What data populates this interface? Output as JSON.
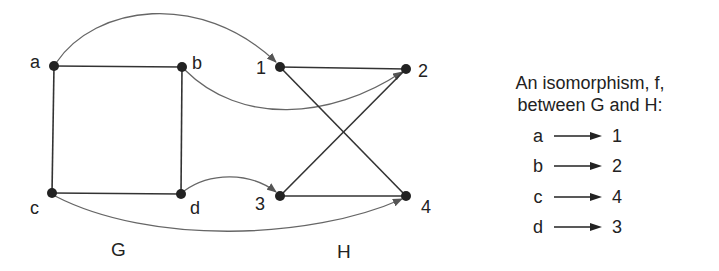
{
  "colors": {
    "edge": "#333333",
    "arc": "#666666",
    "node": "#222222",
    "text": "#222222"
  },
  "graph_g": {
    "name": "G",
    "nodes": [
      {
        "id": "a",
        "label": "a",
        "x": 54,
        "y": 66
      },
      {
        "id": "b",
        "label": "b",
        "x": 182,
        "y": 67
      },
      {
        "id": "c",
        "label": "c",
        "x": 52,
        "y": 193
      },
      {
        "id": "d",
        "label": "d",
        "x": 181,
        "y": 194
      }
    ],
    "edges": [
      [
        "a",
        "b"
      ],
      [
        "a",
        "c"
      ],
      [
        "b",
        "d"
      ],
      [
        "c",
        "d"
      ]
    ]
  },
  "graph_h": {
    "name": "H",
    "nodes": [
      {
        "id": "1",
        "label": "1",
        "x": 280,
        "y": 67
      },
      {
        "id": "2",
        "label": "2",
        "x": 406,
        "y": 69
      },
      {
        "id": "3",
        "label": "3",
        "x": 280,
        "y": 196
      },
      {
        "id": "4",
        "label": "4",
        "x": 406,
        "y": 196
      }
    ],
    "edges": [
      [
        "1",
        "2"
      ],
      [
        "1",
        "4"
      ],
      [
        "3",
        "2"
      ],
      [
        "3",
        "4"
      ]
    ]
  },
  "caption": {
    "line1": "An isomorphism, f,",
    "line2": "between G and H:"
  },
  "mapping": [
    {
      "from": "a",
      "to": "1"
    },
    {
      "from": "b",
      "to": "2"
    },
    {
      "from": "c",
      "to": "4"
    },
    {
      "from": "d",
      "to": "3"
    }
  ]
}
